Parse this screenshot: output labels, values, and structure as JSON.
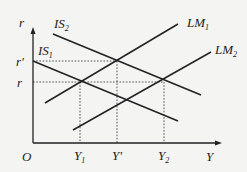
{
  "diagram": {
    "type": "IS-LM",
    "colors": {
      "background": "#f4f4f2",
      "line": "#222222",
      "guide": "#555555"
    },
    "axes": {
      "y_label": "r",
      "x_label": "Y",
      "origin_label": "O",
      "y_ticks": [
        {
          "label": "r",
          "prime": "'",
          "base": "r"
        },
        {
          "label": "r",
          "base": "r"
        }
      ],
      "x_ticks": [
        {
          "base": "Y",
          "sub": "1"
        },
        {
          "base": "Y",
          "prime": "'"
        },
        {
          "base": "Y",
          "sub": "2"
        }
      ]
    },
    "curves": [
      {
        "id": "IS2",
        "base": "IS",
        "sub": "2"
      },
      {
        "id": "IS1",
        "base": "IS",
        "sub": "1"
      },
      {
        "id": "LM1",
        "base": "LM",
        "sub": "1"
      },
      {
        "id": "LM2",
        "base": "LM",
        "sub": "2"
      }
    ]
  }
}
